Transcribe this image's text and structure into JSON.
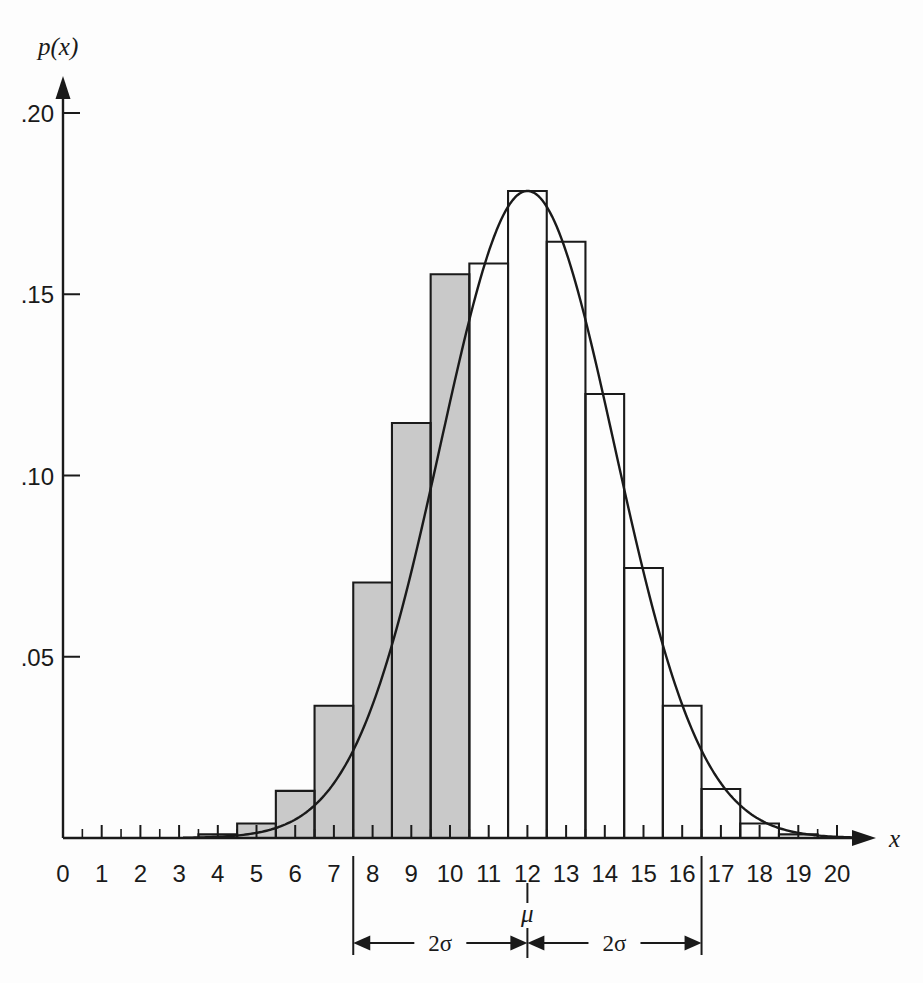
{
  "chart_data": {
    "type": "bar",
    "title": "",
    "subtitle": "",
    "xlabel": "x",
    "ylabel": "p(x)",
    "xlim": [
      0,
      20
    ],
    "ylim": [
      0,
      0.205
    ],
    "grid": false,
    "legend": null,
    "bin_width": 1,
    "note": "Binomial/discrete histogram with superimposed normal density curve; bars are centered on integer x values spanning x-0.5 to x+0.5.",
    "categories": [
      "0",
      "1",
      "2",
      "3",
      "4",
      "5",
      "6",
      "7",
      "8",
      "9",
      "10",
      "11",
      "12",
      "13",
      "14",
      "15",
      "16",
      "17",
      "18",
      "19",
      "20"
    ],
    "values": [
      0.0,
      0.0,
      0.0,
      0.0,
      0.001,
      0.004,
      0.013,
      0.0365,
      0.0705,
      0.1145,
      0.1555,
      0.1585,
      0.1785,
      0.1645,
      0.1225,
      0.0745,
      0.0365,
      0.0135,
      0.004,
      0.001,
      0.0
    ],
    "bars": [
      {
        "center": 0,
        "left": -0.5,
        "right": 0.5,
        "height": 0.0,
        "shaded": false
      },
      {
        "center": 1,
        "left": 0.5,
        "right": 1.5,
        "height": 0.0,
        "shaded": false
      },
      {
        "center": 2,
        "left": 1.5,
        "right": 2.5,
        "height": 0.0,
        "shaded": false
      },
      {
        "center": 3,
        "left": 2.5,
        "right": 3.5,
        "height": 0.0,
        "shaded": false
      },
      {
        "center": 4,
        "left": 3.5,
        "right": 4.5,
        "height": 0.001,
        "shaded": true
      },
      {
        "center": 5,
        "left": 4.5,
        "right": 5.5,
        "height": 0.004,
        "shaded": true
      },
      {
        "center": 6,
        "left": 5.5,
        "right": 6.5,
        "height": 0.013,
        "shaded": true
      },
      {
        "center": 7,
        "left": 6.5,
        "right": 7.5,
        "height": 0.0365,
        "shaded": true
      },
      {
        "center": 8,
        "left": 7.5,
        "right": 8.5,
        "height": 0.0705,
        "shaded": true
      },
      {
        "center": 9,
        "left": 8.5,
        "right": 9.5,
        "height": 0.1145,
        "shaded": true
      },
      {
        "center": 10,
        "left": 9.5,
        "right": 10.5,
        "height": 0.1555,
        "shaded": true
      },
      {
        "center": 11,
        "left": 10.5,
        "right": 11.5,
        "height": 0.1585,
        "shaded": false
      },
      {
        "center": 12,
        "left": 11.5,
        "right": 12.5,
        "height": 0.1785,
        "shaded": false
      },
      {
        "center": 13,
        "left": 12.5,
        "right": 13.5,
        "height": 0.1645,
        "shaded": false
      },
      {
        "center": 14,
        "left": 13.5,
        "right": 14.5,
        "height": 0.1225,
        "shaded": false
      },
      {
        "center": 15,
        "left": 14.5,
        "right": 15.5,
        "height": 0.0745,
        "shaded": false
      },
      {
        "center": 16,
        "left": 15.5,
        "right": 16.5,
        "height": 0.0365,
        "shaded": false
      },
      {
        "center": 17,
        "left": 16.5,
        "right": 17.5,
        "height": 0.0135,
        "shaded": false
      },
      {
        "center": 18,
        "left": 17.5,
        "right": 18.5,
        "height": 0.004,
        "shaded": false
      },
      {
        "center": 19,
        "left": 18.5,
        "right": 19.5,
        "height": 0.001,
        "shaded": false
      },
      {
        "center": 20,
        "left": 19.5,
        "right": 20.5,
        "height": 0.0,
        "shaded": false
      }
    ],
    "curve": {
      "name": "normal density",
      "mu": 12,
      "sigma": 2.25,
      "peak": 0.1785
    },
    "shaded_region": {
      "from": 3.5,
      "to": 10.5,
      "color": "#c9c9c9",
      "description": "gray shaded area under the curve from the left tail up to x = 10.5"
    },
    "x_ticks_major": [
      "0",
      "1",
      "2",
      "3",
      "4",
      "5",
      "6",
      "7",
      "8",
      "9",
      "10",
      "11",
      "12",
      "13",
      "14",
      "15",
      "16",
      "17",
      "18",
      "19",
      "20"
    ],
    "x_ticks_minor_at_half_units": true,
    "y_ticks": [
      {
        "value": 0.05,
        "label": ".05"
      },
      {
        "value": 0.1,
        "label": ".10"
      },
      {
        "value": 0.15,
        "label": ".15"
      },
      {
        "value": 0.2,
        "label": ".20"
      }
    ],
    "annotations": [
      {
        "name": "mu-marker",
        "label": "μ",
        "x": 12
      },
      {
        "name": "left-span",
        "label": "2σ",
        "from": 7.5,
        "to": 12
      },
      {
        "name": "right-span",
        "label": "2σ",
        "from": 12,
        "to": 16.5
      },
      {
        "name": "left-boundary-line",
        "x": 7.5
      },
      {
        "name": "right-boundary-line",
        "x": 16.5
      }
    ],
    "colors": {
      "ink": "#1a1a1a",
      "shade": "#c9c9c9",
      "background": "#fdfdfd"
    }
  }
}
